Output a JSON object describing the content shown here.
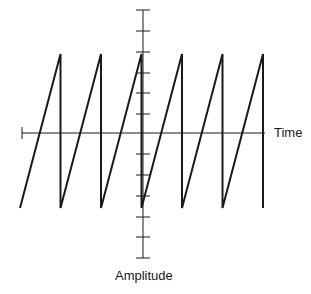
{
  "diagram": {
    "type": "sawtooth-waveform",
    "x_axis_label": "Time",
    "y_axis_label": "Amplitude",
    "colors": {
      "line": "#1a1a1a",
      "background": "#ffffff"
    },
    "waveform": {
      "cycles": 6,
      "x_start": 20,
      "period": 40.5,
      "y_peak": 54,
      "y_trough": 208
    },
    "axes": {
      "x_axis": {
        "y": 133,
        "x_start": 22,
        "x_end": 265
      },
      "y_axis": {
        "x": 143,
        "y_start": 10,
        "y_end": 258,
        "ticks_y": [
          10,
          31,
          52,
          73,
          93,
          114,
          154,
          175,
          196,
          217,
          237,
          258
        ]
      }
    }
  }
}
